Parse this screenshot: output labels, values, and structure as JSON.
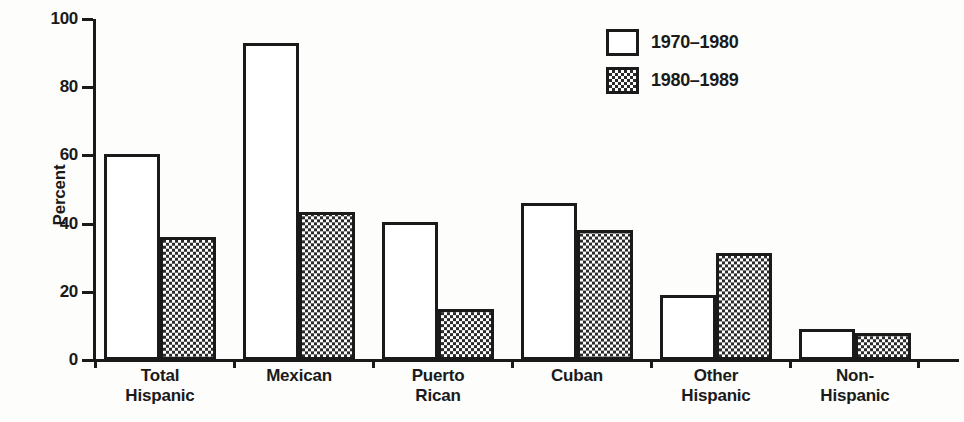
{
  "chart_data": {
    "type": "bar",
    "title": "",
    "xlabel": "",
    "ylabel": "Percent",
    "ylim": [
      0,
      100
    ],
    "yticks": [
      0,
      20,
      40,
      60,
      80,
      100
    ],
    "grid": false,
    "legend_position": "top-right",
    "categories": [
      "Total Hispanic",
      "Mexican",
      "Puerto Rican",
      "Cuban",
      "Other Hispanic",
      "Non-Hispanic"
    ],
    "category_lines": [
      [
        "Total",
        "Hispanic"
      ],
      [
        "Mexican",
        ""
      ],
      [
        "Puerto",
        "Rican"
      ],
      [
        "Cuban",
        ""
      ],
      [
        "Other",
        "Hispanic"
      ],
      [
        "Non-",
        "Hispanic"
      ]
    ],
    "series": [
      {
        "name": "1970–1980",
        "pattern": "open",
        "values": [
          60.5,
          93.0,
          40.5,
          46.0,
          19.0,
          9.0
        ]
      },
      {
        "name": "1980–1989",
        "pattern": "checkered",
        "values": [
          36.0,
          43.5,
          15.0,
          38.0,
          31.5,
          8.0
        ]
      }
    ]
  },
  "axis": {
    "ylabel": "Percent",
    "tick_labels": [
      "100",
      "80",
      "60",
      "40",
      "20",
      "0"
    ]
  },
  "legend": {
    "items": [
      {
        "label": "1970–1980",
        "pattern": "open"
      },
      {
        "label": "1980–1989",
        "pattern": "checkered"
      }
    ]
  },
  "colors": {
    "ink": "#1a1a1a",
    "paper": "#fdfdfb",
    "bar_open": "#ffffff",
    "bar_hatch": "#2b2b2b"
  }
}
